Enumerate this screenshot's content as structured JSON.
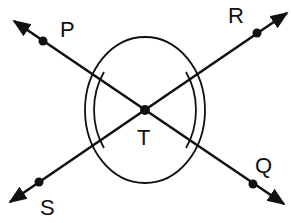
{
  "diagram": {
    "type": "intersecting-lines-angle",
    "labels": {
      "P": "P",
      "Q": "Q",
      "R": "R",
      "S": "S",
      "T": "T"
    },
    "lines": [
      {
        "name": "line-PQ",
        "through": [
          "P",
          "T",
          "Q"
        ]
      },
      {
        "name": "line-SR",
        "through": [
          "S",
          "T",
          "R"
        ]
      }
    ],
    "intersection": "T",
    "angle_marks": [
      "outer ellipse around T",
      "double arcs marking angle PTS",
      "double arcs marking angle RTQ"
    ],
    "colors": {
      "stroke": "#111111",
      "background": "#ffffff"
    }
  }
}
